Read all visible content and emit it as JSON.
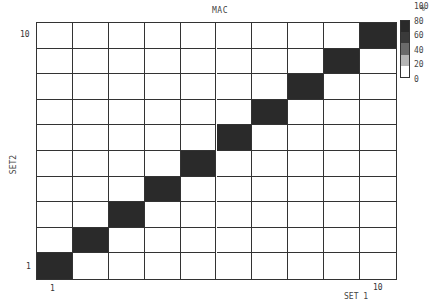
{
  "chart_data": {
    "type": "heatmap",
    "title": "MAC",
    "xlabel": "SET 1",
    "ylabel": "SET2",
    "x_ticks": [
      "1",
      "10"
    ],
    "y_ticks": [
      "1",
      "10"
    ],
    "x": [
      1,
      2,
      3,
      4,
      5,
      6,
      7,
      8,
      9,
      10
    ],
    "y": [
      1,
      2,
      3,
      4,
      5,
      6,
      7,
      8,
      9,
      10
    ],
    "values": [
      [
        100,
        0,
        0,
        0,
        0,
        0,
        0,
        0,
        0,
        0
      ],
      [
        0,
        100,
        0,
        0,
        0,
        0,
        0,
        0,
        0,
        0
      ],
      [
        0,
        0,
        100,
        0,
        0,
        0,
        0,
        0,
        0,
        0
      ],
      [
        0,
        0,
        0,
        100,
        0,
        0,
        0,
        0,
        0,
        0
      ],
      [
        0,
        0,
        0,
        0,
        100,
        0,
        0,
        0,
        0,
        0
      ],
      [
        0,
        0,
        0,
        0,
        0,
        100,
        0,
        0,
        0,
        0
      ],
      [
        0,
        0,
        0,
        0,
        0,
        0,
        100,
        0,
        0,
        0
      ],
      [
        0,
        0,
        0,
        0,
        0,
        0,
        0,
        100,
        0,
        0
      ],
      [
        0,
        0,
        0,
        0,
        0,
        0,
        0,
        0,
        100,
        0
      ],
      [
        0,
        0,
        0,
        0,
        0,
        0,
        0,
        0,
        0,
        100
      ]
    ],
    "values_note": "rows indexed by SET2 (1 at bottom), columns by SET 1",
    "colorbar": {
      "unit": "%",
      "ticks": [
        "100",
        "80",
        "60",
        "40",
        "20",
        "0"
      ],
      "colors": [
        "#2a2a2a",
        "#3a3a3a",
        "#6a6a6a",
        "#b5b5b5",
        "#ffffff"
      ]
    },
    "grid": true
  },
  "labels": {
    "title": "MAC",
    "xlabel": "SET 1",
    "ylabel": "SET2",
    "x_tick_min": "1",
    "x_tick_max": "10",
    "y_tick_min": "1",
    "y_tick_max": "10",
    "legend_unit": "%",
    "legend_ticks": [
      "100",
      "80",
      "60",
      "40",
      "20",
      "0"
    ]
  }
}
